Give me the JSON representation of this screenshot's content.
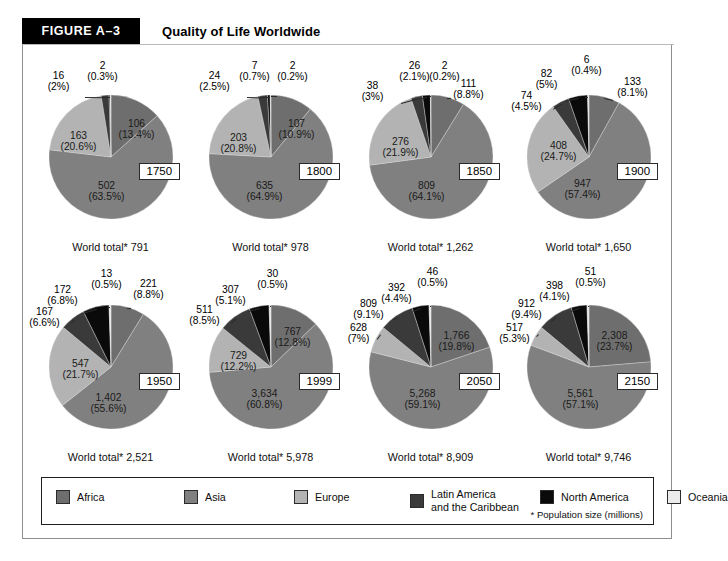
{
  "header": {
    "tag": "FIGURE A–3",
    "title": "Quality of Life Worldwide"
  },
  "legend": {
    "items": [
      {
        "label": "Africa",
        "color": "#6e6e6e"
      },
      {
        "label": "Asia",
        "color": "#808080"
      },
      {
        "label": "Europe",
        "color": "#b3b3b3"
      },
      {
        "label": "Latin America\nand the Caribbean",
        "label_line1": "Latin America",
        "label_line2": "and the Caribbean",
        "color": "#3a3a3a"
      },
      {
        "label": "North America",
        "color": "#0a0a0a"
      },
      {
        "label": "Oceania",
        "color": "#ececec"
      }
    ],
    "footnote": "* Population size (millions)"
  },
  "chart_data": {
    "type": "pie",
    "title": "Quality of Life Worldwide",
    "regions": [
      "Africa",
      "Asia",
      "Europe",
      "Latin America and the Caribbean",
      "North America",
      "Oceania"
    ],
    "colors": [
      "#6e6e6e",
      "#808080",
      "#b3b3b3",
      "#3a3a3a",
      "#0a0a0a",
      "#ececec"
    ],
    "units": "millions",
    "charts": [
      {
        "year": "1750",
        "world_total": "World total* 791",
        "values": [
          106,
          502,
          163,
          16,
          2,
          2
        ],
        "labels": [
          {
            "value": "106",
            "pct": "(13.4%)"
          },
          {
            "value": "502",
            "pct": "(63.5%)"
          },
          {
            "value": "163",
            "pct": "(20.6%)"
          },
          {
            "value": "16",
            "pct": "(2%)"
          },
          {
            "value": "2",
            "pct": "(0.3%)"
          },
          {
            "value": "2",
            "pct": "(0.3%)"
          }
        ]
      },
      {
        "year": "1800",
        "world_total": "World total* 978",
        "values": [
          107,
          635,
          203,
          24,
          7,
          2
        ],
        "labels": [
          {
            "value": "107",
            "pct": "(10.9%)"
          },
          {
            "value": "635",
            "pct": "(64.9%)"
          },
          {
            "value": "203",
            "pct": "(20.8%)"
          },
          {
            "value": "24",
            "pct": "(2.5%)"
          },
          {
            "value": "7",
            "pct": "(0.7%)"
          },
          {
            "value": "2",
            "pct": "(0.2%)"
          }
        ]
      },
      {
        "year": "1850",
        "world_total": "World total* 1,262",
        "values": [
          111,
          809,
          276,
          38,
          26,
          2
        ],
        "labels": [
          {
            "value": "111",
            "pct": "(8.8%)"
          },
          {
            "value": "809",
            "pct": "(64.1%)"
          },
          {
            "value": "276",
            "pct": "(21.9%)"
          },
          {
            "value": "38",
            "pct": "(3%)"
          },
          {
            "value": "26",
            "pct": "(2.1%)"
          },
          {
            "value": "2",
            "pct": "(0.2%)"
          }
        ]
      },
      {
        "year": "1900",
        "world_total": "World total* 1,650",
        "values": [
          133,
          947,
          408,
          74,
          82,
          6
        ],
        "labels": [
          {
            "value": "133",
            "pct": "(8.1%)"
          },
          {
            "value": "947",
            "pct": "(57.4%)"
          },
          {
            "value": "408",
            "pct": "(24.7%)"
          },
          {
            "value": "74",
            "pct": "(4.5%)"
          },
          {
            "value": "82",
            "pct": "(5%)"
          },
          {
            "value": "6",
            "pct": "(0.4%)"
          }
        ]
      },
      {
        "year": "1950",
        "world_total": "World total* 2,521",
        "values": [
          221,
          1402,
          547,
          167,
          172,
          13
        ],
        "labels": [
          {
            "value": "221",
            "pct": "(8.8%)"
          },
          {
            "value": "1,402",
            "pct": "(55.6%)"
          },
          {
            "value": "547",
            "pct": "(21.7%)"
          },
          {
            "value": "167",
            "pct": "(6.6%)"
          },
          {
            "value": "172",
            "pct": "(6.8%)"
          },
          {
            "value": "13",
            "pct": "(0.5%)"
          }
        ]
      },
      {
        "year": "1999",
        "world_total": "World total* 5,978",
        "values": [
          767,
          3634,
          729,
          511,
          307,
          30
        ],
        "labels": [
          {
            "value": "767",
            "pct": "(12.8%)"
          },
          {
            "value": "3,634",
            "pct": "(60.8%)"
          },
          {
            "value": "729",
            "pct": "(12.2%)"
          },
          {
            "value": "511",
            "pct": "(8.5%)"
          },
          {
            "value": "307",
            "pct": "(5.1%)"
          },
          {
            "value": "30",
            "pct": "(0.5%)"
          }
        ]
      },
      {
        "year": "2050",
        "world_total": "World total* 8,909",
        "values": [
          1766,
          5268,
          628,
          809,
          392,
          46
        ],
        "labels": [
          {
            "value": "1,766",
            "pct": "(19.8%)"
          },
          {
            "value": "5,268",
            "pct": "(59.1%)"
          },
          {
            "value": "628",
            "pct": "(7%)"
          },
          {
            "value": "809",
            "pct": "(9.1%)"
          },
          {
            "value": "392",
            "pct": "(4.4%)"
          },
          {
            "value": "46",
            "pct": "(0.5%)"
          }
        ]
      },
      {
        "year": "2150",
        "world_total": "World total* 9,746",
        "values": [
          2308,
          5561,
          517,
          912,
          398,
          51
        ],
        "labels": [
          {
            "value": "2,308",
            "pct": "(23.7%)"
          },
          {
            "value": "5,561",
            "pct": "(57.1%)"
          },
          {
            "value": "517",
            "pct": "(5.3%)"
          },
          {
            "value": "912",
            "pct": "(9.4%)"
          },
          {
            "value": "398",
            "pct": "(4.1%)"
          },
          {
            "value": "51",
            "pct": "(0.5%)"
          }
        ]
      }
    ]
  }
}
